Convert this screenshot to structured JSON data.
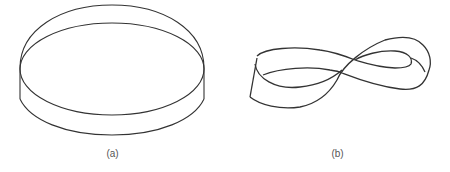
{
  "figure": {
    "panels": [
      {
        "id": "a",
        "caption": "(a)",
        "subject": "cylinder-band"
      },
      {
        "id": "b",
        "caption": "(b)",
        "subject": "mobius-strip"
      }
    ],
    "colors": {
      "stroke": "#333333",
      "background": "#ffffff",
      "caption": "#555555"
    }
  }
}
